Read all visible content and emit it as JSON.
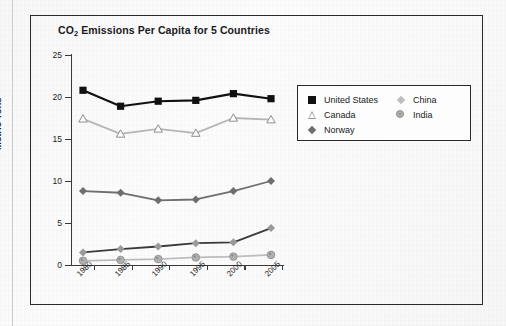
{
  "chart_data": {
    "type": "line",
    "title": "CO2 Emissions Per Capita for 5 Countries",
    "title_prefix": "CO",
    "title_sub": "2",
    "title_rest": " Emissions Per Capita for 5 Countries",
    "xlabel": "",
    "ylabel": "Metric Tons",
    "x": [
      "1980",
      "1985",
      "1990",
      "1995",
      "2000",
      "2005"
    ],
    "categories": [
      "1980",
      "1985",
      "1990",
      "1995",
      "2000",
      "2005"
    ],
    "ylim": [
      0,
      25
    ],
    "yticks": [
      "0",
      "5",
      "10",
      "15",
      "20",
      "25"
    ],
    "grid": false,
    "legend_position": "upper-right-outside",
    "series": [
      {
        "name": "United States",
        "marker": "square",
        "color": "#111111",
        "line_color": "#111111",
        "values": [
          20.8,
          18.9,
          19.5,
          19.6,
          20.4,
          19.8
        ]
      },
      {
        "name": "Canada",
        "marker": "triangle-open",
        "color": "#9a9a9a",
        "line_color": "#b5b5b5",
        "values": [
          17.4,
          15.6,
          16.2,
          15.7,
          17.5,
          17.3
        ]
      },
      {
        "name": "Norway",
        "marker": "diamond",
        "color": "#6e6e6e",
        "line_color": "#6e6e6e",
        "values": [
          8.8,
          8.6,
          7.7,
          7.8,
          8.8,
          10.0
        ]
      },
      {
        "name": "China",
        "marker": "diamond-light",
        "color": "#9a9a9a",
        "line_color": "#3a3a3a",
        "values": [
          1.5,
          1.9,
          2.2,
          2.6,
          2.7,
          4.4
        ]
      },
      {
        "name": "India",
        "marker": "circle",
        "color": "#b0b0b0",
        "line_color": "#bdbdbd",
        "values": [
          0.5,
          0.6,
          0.7,
          0.9,
          1.0,
          1.2
        ]
      }
    ]
  },
  "legend": {
    "left_column": [
      {
        "label": "United States",
        "marker": "square"
      },
      {
        "label": "Canada",
        "marker": "triangle-open"
      },
      {
        "label": "Norway",
        "marker": "diamond"
      }
    ],
    "right_column": [
      {
        "label": "China",
        "marker": "diamond-light"
      },
      {
        "label": "India",
        "marker": "circle"
      }
    ]
  },
  "colors": {
    "united_states": "#111111",
    "canada": "#b5b5b5",
    "norway": "#6e6e6e",
    "china": "#3a3a3a",
    "india": "#bdbdbd",
    "axis": "#3a3a3a",
    "frame": "#2a2a2a",
    "background": "#fbfbfb"
  }
}
